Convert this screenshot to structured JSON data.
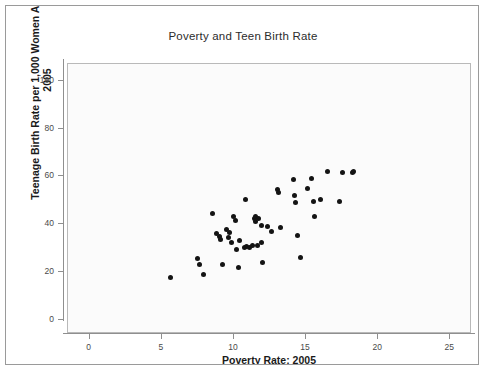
{
  "chart_data": {
    "type": "scatter",
    "title": "Poverty and Teen Birth Rate",
    "xlabel": "Poverty Rate: 2005",
    "ylabel_line1": "Teenage Birth Rate per 1,000 Women Age 15-19:",
    "ylabel_line2": "2005",
    "xlim": [
      -1.5,
      26.5
    ],
    "ylim": [
      -6,
      107
    ],
    "xticks": [
      0,
      5,
      10,
      15,
      20,
      25
    ],
    "yticks": [
      0,
      20,
      40,
      60,
      80,
      100
    ],
    "xtick_labels": [
      "0",
      "5",
      "10",
      "15",
      "20",
      "25"
    ],
    "ytick_labels": [
      "0",
      "20",
      "40",
      "60",
      "80",
      "100"
    ],
    "grid": false,
    "legend": "none",
    "marker": "filled-circle",
    "marker_color": "#141414",
    "panel_background": "#fbfbfb",
    "n_points": 51,
    "points": [
      {
        "x": 5.6,
        "y": 17.7
      },
      {
        "x": 7.5,
        "y": 25.5
      },
      {
        "x": 7.6,
        "y": 23.1
      },
      {
        "x": 7.9,
        "y": 19.1
      },
      {
        "x": 8.5,
        "y": 44.3
      },
      {
        "x": 8.8,
        "y": 36.0
      },
      {
        "x": 9.0,
        "y": 34.8
      },
      {
        "x": 9.1,
        "y": 33.5
      },
      {
        "x": 9.2,
        "y": 23.2
      },
      {
        "x": 9.5,
        "y": 37.6
      },
      {
        "x": 9.6,
        "y": 34.3
      },
      {
        "x": 9.7,
        "y": 36.5
      },
      {
        "x": 9.8,
        "y": 32.3
      },
      {
        "x": 10.0,
        "y": 43.0
      },
      {
        "x": 10.1,
        "y": 41.7
      },
      {
        "x": 10.2,
        "y": 29.3
      },
      {
        "x": 10.3,
        "y": 21.7
      },
      {
        "x": 10.4,
        "y": 33.0
      },
      {
        "x": 10.7,
        "y": 30.2
      },
      {
        "x": 10.8,
        "y": 50.2
      },
      {
        "x": 10.9,
        "y": 30.5
      },
      {
        "x": 11.1,
        "y": 30.3
      },
      {
        "x": 11.3,
        "y": 31.2
      },
      {
        "x": 11.4,
        "y": 42.4
      },
      {
        "x": 11.5,
        "y": 41.0
      },
      {
        "x": 11.5,
        "y": 43.2
      },
      {
        "x": 11.6,
        "y": 30.9
      },
      {
        "x": 11.7,
        "y": 42.2
      },
      {
        "x": 11.9,
        "y": 39.6
      },
      {
        "x": 11.9,
        "y": 32.5
      },
      {
        "x": 12.0,
        "y": 24.0
      },
      {
        "x": 12.3,
        "y": 38.8
      },
      {
        "x": 12.6,
        "y": 36.9
      },
      {
        "x": 13.0,
        "y": 54.4
      },
      {
        "x": 13.1,
        "y": 53.3
      },
      {
        "x": 13.2,
        "y": 38.5
      },
      {
        "x": 14.1,
        "y": 58.7
      },
      {
        "x": 14.2,
        "y": 51.9
      },
      {
        "x": 14.3,
        "y": 49.0
      },
      {
        "x": 14.4,
        "y": 35.4
      },
      {
        "x": 14.6,
        "y": 26.1
      },
      {
        "x": 15.1,
        "y": 55.0
      },
      {
        "x": 15.4,
        "y": 59.2
      },
      {
        "x": 15.5,
        "y": 49.6
      },
      {
        "x": 15.6,
        "y": 43.3
      },
      {
        "x": 16.0,
        "y": 50.3
      },
      {
        "x": 16.5,
        "y": 61.9
      },
      {
        "x": 17.3,
        "y": 49.6
      },
      {
        "x": 17.5,
        "y": 61.6
      },
      {
        "x": 18.2,
        "y": 61.8
      },
      {
        "x": 18.3,
        "y": 62.0
      }
    ]
  }
}
